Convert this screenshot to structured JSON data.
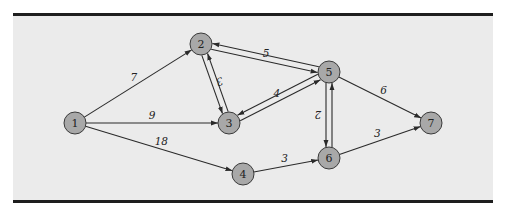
{
  "diagram": {
    "type": "directed-weighted-network",
    "background": "#ebebeb",
    "node_fill": "#a8a8a8",
    "border_color": "#1e1e1e",
    "nodes": [
      {
        "id": "1",
        "label": "1",
        "x": 75,
        "y": 123
      },
      {
        "id": "2",
        "label": "2",
        "x": 201,
        "y": 44
      },
      {
        "id": "3",
        "label": "3",
        "x": 229,
        "y": 123
      },
      {
        "id": "4",
        "label": "4",
        "x": 243,
        "y": 174
      },
      {
        "id": "5",
        "label": "5",
        "x": 329,
        "y": 72
      },
      {
        "id": "6",
        "label": "6",
        "x": 329,
        "y": 158
      },
      {
        "id": "7",
        "label": "7",
        "x": 431,
        "y": 123
      }
    ],
    "edges": [
      {
        "from": "1",
        "to": "2",
        "weight": "7"
      },
      {
        "from": "1",
        "to": "3",
        "weight": "9"
      },
      {
        "from": "1",
        "to": "4",
        "weight": "18"
      },
      {
        "from": "2",
        "to": "5",
        "weight": "5"
      },
      {
        "from": "5",
        "to": "2",
        "weight": ""
      },
      {
        "from": "2",
        "to": "3",
        "weight": "3"
      },
      {
        "from": "3",
        "to": "2",
        "weight": ""
      },
      {
        "from": "3",
        "to": "5",
        "weight": "4"
      },
      {
        "from": "5",
        "to": "3",
        "weight": ""
      },
      {
        "from": "5",
        "to": "6",
        "weight": "2"
      },
      {
        "from": "6",
        "to": "5",
        "weight": ""
      },
      {
        "from": "5",
        "to": "7",
        "weight": "6"
      },
      {
        "from": "4",
        "to": "6",
        "weight": "3"
      },
      {
        "from": "6",
        "to": "7",
        "weight": "3"
      }
    ]
  }
}
